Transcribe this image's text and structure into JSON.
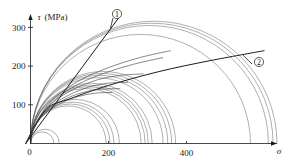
{
  "figure": {
    "name": "mohr-circle-failure-envelope",
    "background": "#ffffff",
    "line_color": "#2a2a2a",
    "circle_color": "#555555",
    "envelope_color": "#1a1a1a"
  },
  "axes": {
    "y": {
      "label_symbol": "τ",
      "label_unit": "(MPa)",
      "ticks": [
        0,
        100,
        200,
        300
      ],
      "tick_labels": [
        "0",
        "100",
        "200",
        "300"
      ],
      "min": 0,
      "max": 330
    },
    "x": {
      "label_symbol": "σ",
      "ticks": [
        0,
        200,
        400
      ],
      "tick_labels": [
        "0",
        "200",
        "400"
      ],
      "min": -20,
      "max": 640
    }
  },
  "callouts": [
    {
      "id": "callout-1",
      "text": "①",
      "x_px": 117,
      "y_px": 14
    },
    {
      "id": "callout-2",
      "text": "②",
      "x_px": 259,
      "y_px": 62
    }
  ],
  "chart_data": {
    "type": "line",
    "title": "",
    "xlabel": "σ",
    "ylabel": "τ (MPa)",
    "xlim": [
      -20,
      640
    ],
    "ylim": [
      0,
      330
    ],
    "grid": false,
    "legend": [
      "①",
      "②"
    ],
    "legend_position": "inline-callout",
    "annotations": [
      {
        "label": "①",
        "meaning": "straight Mohr-Coulomb failure envelope"
      },
      {
        "label": "②",
        "meaning": "curved failure envelope"
      }
    ],
    "mohr_circles": [
      {
        "sigma_left": 0,
        "sigma_right": 60,
        "center": 30,
        "radius": 30
      },
      {
        "sigma_left": 0,
        "sigma_right": 75,
        "center": 37,
        "radius": 37
      },
      {
        "sigma_left": 0,
        "sigma_right": 195,
        "center": 97,
        "radius": 97
      },
      {
        "sigma_left": 0,
        "sigma_right": 205,
        "center": 102,
        "radius": 102
      },
      {
        "sigma_left": 0,
        "sigma_right": 215,
        "center": 107,
        "radius": 107
      },
      {
        "sigma_left": 0,
        "sigma_right": 228,
        "center": 114,
        "radius": 114
      },
      {
        "sigma_left": 0,
        "sigma_right": 285,
        "center": 142,
        "radius": 142
      },
      {
        "sigma_left": 0,
        "sigma_right": 295,
        "center": 147,
        "radius": 147
      },
      {
        "sigma_left": 0,
        "sigma_right": 303,
        "center": 151,
        "radius": 151
      },
      {
        "sigma_left": 0,
        "sigma_right": 312,
        "center": 156,
        "radius": 156
      },
      {
        "sigma_left": 0,
        "sigma_right": 340,
        "center": 170,
        "radius": 170
      },
      {
        "sigma_left": 0,
        "sigma_right": 352,
        "center": 176,
        "radius": 176
      },
      {
        "sigma_left": 0,
        "sigma_right": 362,
        "center": 181,
        "radius": 181
      },
      {
        "sigma_left": 0,
        "sigma_right": 372,
        "center": 186,
        "radius": 186
      },
      {
        "sigma_left": 0,
        "sigma_right": 565,
        "center": 282,
        "radius": 282
      },
      {
        "sigma_left": 0,
        "sigma_right": 610,
        "center": 305,
        "radius": 305
      },
      {
        "sigma_left": 0,
        "sigma_right": 622,
        "center": 311,
        "radius": 311
      },
      {
        "sigma_left": 0,
        "sigma_right": 632,
        "center": 316,
        "radius": 316
      }
    ],
    "envelopes": [
      {
        "name": "envelope-1-straight",
        "kind": "straight",
        "label": "①",
        "points": [
          [
            -12,
            0
          ],
          [
            230,
            330
          ]
        ]
      },
      {
        "name": "envelope-2-curved",
        "kind": "curved",
        "label": "②",
        "points": [
          [
            -12,
            0
          ],
          [
            40,
            88
          ],
          [
            100,
            115
          ],
          [
            200,
            150
          ],
          [
            330,
            186
          ],
          [
            460,
            214
          ],
          [
            600,
            240
          ]
        ]
      },
      {
        "name": "envelope-3",
        "kind": "curved",
        "points": [
          [
            -12,
            0
          ],
          [
            30,
            80
          ],
          [
            70,
            125
          ],
          [
            130,
            165
          ],
          [
            200,
            196
          ],
          [
            280,
            222
          ],
          [
            360,
            240
          ]
        ]
      },
      {
        "name": "envelope-4",
        "kind": "curved",
        "points": [
          [
            -12,
            0
          ],
          [
            28,
            75
          ],
          [
            65,
            115
          ],
          [
            120,
            152
          ],
          [
            190,
            182
          ],
          [
            265,
            205
          ],
          [
            340,
            222
          ]
        ]
      },
      {
        "name": "envelope-5",
        "kind": "curved",
        "points": [
          [
            -12,
            0
          ],
          [
            25,
            70
          ],
          [
            60,
            108
          ],
          [
            110,
            140
          ],
          [
            170,
            164
          ],
          [
            230,
            176
          ],
          [
            290,
            180
          ]
        ]
      },
      {
        "name": "envelope-6",
        "kind": "curved",
        "points": [
          [
            -12,
            0
          ],
          [
            24,
            66
          ],
          [
            58,
            100
          ],
          [
            100,
            126
          ],
          [
            150,
            146
          ],
          [
            200,
            156
          ],
          [
            250,
            158
          ]
        ]
      },
      {
        "name": "envelope-7",
        "kind": "curved",
        "points": [
          [
            -12,
            0
          ],
          [
            22,
            62
          ],
          [
            52,
            92
          ],
          [
            92,
            116
          ],
          [
            135,
            132
          ],
          [
            180,
            140
          ],
          [
            230,
            142
          ]
        ]
      },
      {
        "name": "envelope-8",
        "kind": "curved",
        "points": [
          [
            -12,
            0
          ],
          [
            20,
            58
          ],
          [
            48,
            86
          ],
          [
            85,
            108
          ],
          [
            125,
            122
          ],
          [
            165,
            130
          ],
          [
            210,
            132
          ]
        ]
      }
    ]
  }
}
